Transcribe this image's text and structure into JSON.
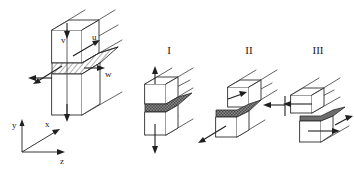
{
  "figure": {
    "background_color": "#ffffff",
    "line_color": "#2b2b2b",
    "crack_fill_color": "#6d6d6d"
  },
  "main_block": {
    "name": "general-crack-displacement-block",
    "displacement_labels": {
      "v": "v",
      "u": "u",
      "w": "w"
    },
    "description": "Three dimensional body containing a crack with hatched crack surface and displacement components u, v, w"
  },
  "axes": {
    "name": "coordinate-triad",
    "y": "y",
    "x": "x",
    "z": "z"
  },
  "modes": [
    {
      "id": "mode-1",
      "label": "I",
      "name": "opening-mode",
      "arrow_direction": "vertical-opposed"
    },
    {
      "id": "mode-2",
      "label": "II",
      "name": "in-plane-shear-mode",
      "arrow_direction": "horizontal-opposed-in-plane"
    },
    {
      "id": "mode-3",
      "label": "III",
      "name": "anti-plane-shear-mode",
      "arrow_direction": "horizontal-opposed-out-of-plane"
    }
  ]
}
